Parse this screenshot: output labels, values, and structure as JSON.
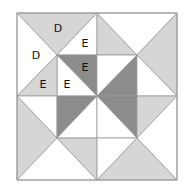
{
  "diagram": {
    "type": "quilt-block",
    "colors": {
      "white": "#ffffff",
      "light": "#d6d6d6",
      "dark": "#8c8c8c",
      "stroke": "#9a9a9a"
    },
    "labels": [
      {
        "text": "D",
        "x": 58,
        "y": 28
      },
      {
        "text": "E",
        "x": 85,
        "y": 43
      },
      {
        "text": "D",
        "x": 36,
        "y": 55
      },
      {
        "text": "E",
        "x": 85,
        "y": 67
      },
      {
        "text": "E",
        "x": 43,
        "y": 84
      },
      {
        "text": "E",
        "x": 67,
        "y": 84
      }
    ]
  }
}
